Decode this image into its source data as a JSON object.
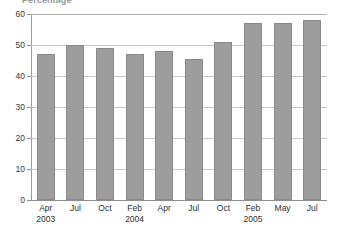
{
  "chart_data": {
    "type": "bar",
    "title": "Percentage",
    "xlabel": "",
    "ylabel": "",
    "ylim": [
      0,
      60
    ],
    "yticks": [
      0,
      10,
      20,
      30,
      40,
      50,
      60
    ],
    "grid": true,
    "legend": "none",
    "categories": [
      "Apr 2003",
      "Jul",
      "Oct",
      "Feb 2004",
      "Apr",
      "Jul",
      "Oct",
      "Feb 2005",
      "May",
      "Jul"
    ],
    "category_labels": [
      {
        "month": "Apr",
        "year": "2003"
      },
      {
        "month": "Jul",
        "year": ""
      },
      {
        "month": "Oct",
        "year": ""
      },
      {
        "month": "Feb",
        "year": "2004"
      },
      {
        "month": "Apr",
        "year": ""
      },
      {
        "month": "Jul",
        "year": ""
      },
      {
        "month": "Oct",
        "year": ""
      },
      {
        "month": "Feb",
        "year": "2005"
      },
      {
        "month": "May",
        "year": ""
      },
      {
        "month": "Jul",
        "year": ""
      }
    ],
    "values": [
      47,
      50,
      49,
      47,
      48,
      45.5,
      51,
      57,
      57,
      58
    ],
    "bar_color": "#9d9d9d",
    "bar_border_color": "#8a8a8a",
    "gridline_color": "#c9c9c9",
    "axis_color": "#8e8e8e",
    "text_color": "#2e2e2e"
  }
}
